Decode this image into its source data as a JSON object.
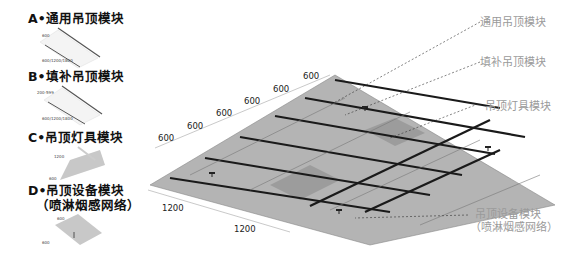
{
  "legend": {
    "modules": [
      {
        "id": "A",
        "title": "A•通用吊顶模块",
        "dims": [
          "600",
          "600/1200/1800"
        ]
      },
      {
        "id": "B",
        "title": "B•填补吊顶模块",
        "dims": [
          "200-599",
          "600/1200/1800"
        ]
      },
      {
        "id": "C",
        "title": "C•吊顶灯具模块",
        "dims": [
          "1200",
          "600"
        ]
      },
      {
        "id": "D",
        "title": "D•吊顶设备模块",
        "subtitle": "（喷淋烟感网络）",
        "dims": [
          "600",
          "600"
        ]
      }
    ]
  },
  "callouts": {
    "general": "通用吊顶模块",
    "filler": "填补吊顶模块",
    "lighting": "吊顶灯具模块",
    "equipment": "吊顶设备模块",
    "equipment_sub": "（喷淋烟感网络）"
  },
  "dimensions": {
    "top": [
      "600",
      "600",
      "600",
      "600",
      "600",
      "600"
    ],
    "bottom": [
      "1200",
      "1200"
    ]
  },
  "colors": {
    "panel": "#b4b4b4",
    "panel_dark": "#9c9c9c",
    "rail": "#1a1a1a",
    "callout_text": "#9a9a9a"
  }
}
